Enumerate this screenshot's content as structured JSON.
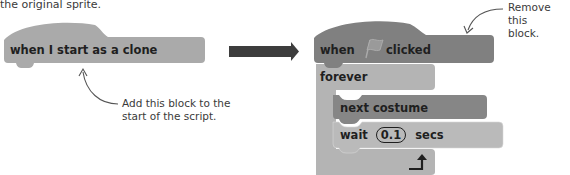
{
  "intro_text": "the original sprite.",
  "left_block": {
    "label": "when I start as a clone",
    "color": "#a8a8a8"
  },
  "left_callout": {
    "line1": "Add this block to the",
    "line2": "start of the script."
  },
  "transition_arrow": {
    "icon": "right-arrow-icon",
    "color": "#3d3d3d"
  },
  "right_callout": {
    "line1": "Remove this",
    "line2": "block."
  },
  "script": {
    "hat_block": {
      "label_before": "when",
      "icon": "green-flag-icon",
      "label_after": "clicked",
      "color": "#7f7f7f"
    },
    "forever_block": {
      "label": "forever",
      "color": "#b4b4b4",
      "loop_icon": "loop-arrow-icon"
    },
    "next_costume_block": {
      "label": "next costume",
      "color": "#858585"
    },
    "wait_block": {
      "label_before": "wait",
      "value": "0.1",
      "label_after": "secs",
      "color": "#b9b9b9"
    }
  }
}
